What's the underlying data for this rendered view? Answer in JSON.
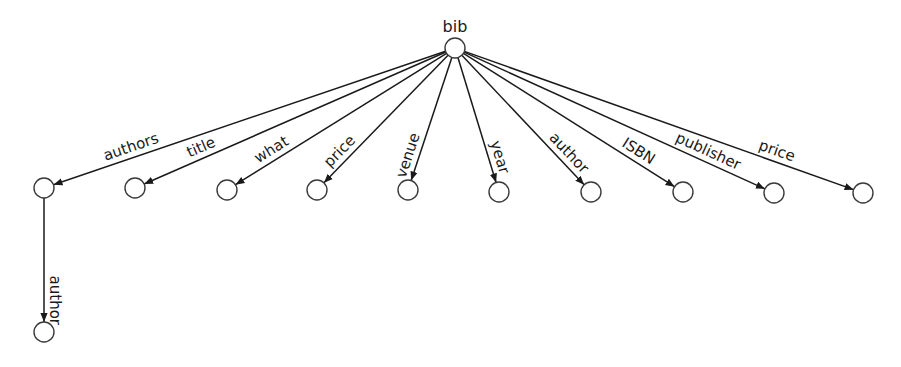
{
  "diagram": {
    "type": "tree",
    "root": {
      "id": "bib",
      "label": "bib",
      "x": 455,
      "y": 48
    },
    "node_radius": 10,
    "nodes": [
      {
        "id": "n1",
        "x": 44,
        "y": 188
      },
      {
        "id": "n2",
        "x": 135,
        "y": 188
      },
      {
        "id": "n3",
        "x": 227,
        "y": 190
      },
      {
        "id": "n4",
        "x": 317,
        "y": 190
      },
      {
        "id": "n5",
        "x": 408,
        "y": 190
      },
      {
        "id": "n6",
        "x": 499,
        "y": 192
      },
      {
        "id": "n7",
        "x": 591,
        "y": 192
      },
      {
        "id": "n8",
        "x": 683,
        "y": 192
      },
      {
        "id": "n9",
        "x": 774,
        "y": 193
      },
      {
        "id": "n10",
        "x": 863,
        "y": 193
      },
      {
        "id": "n11",
        "x": 44,
        "y": 332
      }
    ],
    "edges": [
      {
        "from": "bib",
        "to": "n1",
        "label": "authors"
      },
      {
        "from": "bib",
        "to": "n2",
        "label": "title"
      },
      {
        "from": "bib",
        "to": "n3",
        "label": "what"
      },
      {
        "from": "bib",
        "to": "n4",
        "label": "price"
      },
      {
        "from": "bib",
        "to": "n5",
        "label": "venue"
      },
      {
        "from": "bib",
        "to": "n6",
        "label": "year"
      },
      {
        "from": "bib",
        "to": "n7",
        "label": "author"
      },
      {
        "from": "bib",
        "to": "n8",
        "label": "ISBN"
      },
      {
        "from": "bib",
        "to": "n9",
        "label": "publisher"
      },
      {
        "from": "bib",
        "to": "n10",
        "label": "price"
      },
      {
        "from": "n1",
        "to": "n11",
        "label": "author"
      }
    ]
  }
}
